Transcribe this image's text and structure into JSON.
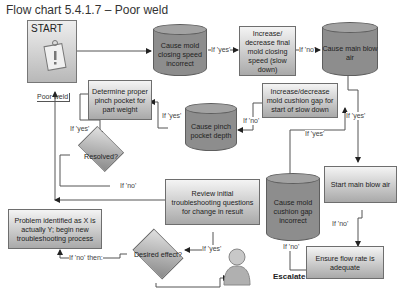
{
  "title": "Flow chart 5.4.1.7 – Poor weld",
  "start": {
    "label": "START",
    "caption": "Poor weld",
    "icon": "clipboard-warning-icon"
  },
  "nodes": {
    "cause_mold_closing_speed": "Cause mold closing speed incorrect",
    "adjust_final_closing_speed": "Increase/ decrease final mold closing speed (slow down)",
    "cause_main_blow_air": "Cause main blow air",
    "adjust_cushion_gap": "Increase/decrease mold cushion gap for start of slow down",
    "cause_pinch_pocket": "Cause pinch pocket depth",
    "determine_pinch_pocket": "Determine proper pinch pocket for part weight",
    "resolved": "Resolved?",
    "review_questions": "Review initial troubleshooting questions for change in result",
    "cause_cushion_gap": "Cause mold cushion gap incorrect",
    "start_main_blow_air": "Start main blow air",
    "problem_identified": "Problem identified as X is actually Y; begin new troubleshooting process",
    "desired_effect": "Desired effect?",
    "ensure_flow_rate": "Ensure flow rate is adequate",
    "escalate": "Escalate"
  },
  "edge_labels": {
    "yes1": "If 'yes'",
    "no1": "If 'no'",
    "yes_right": "If 'yes'",
    "no_cushion": "If 'no'",
    "yes_cushion": "If 'yes'",
    "yes_pinch": "If 'yes'",
    "yes_resolved": "If 'yes'",
    "no_resolved": "If 'no'",
    "yes_desired": "If 'yes'",
    "no_then": "If 'no' then:",
    "no_blow": "If 'no'",
    "no_gap": "If 'no'"
  }
}
